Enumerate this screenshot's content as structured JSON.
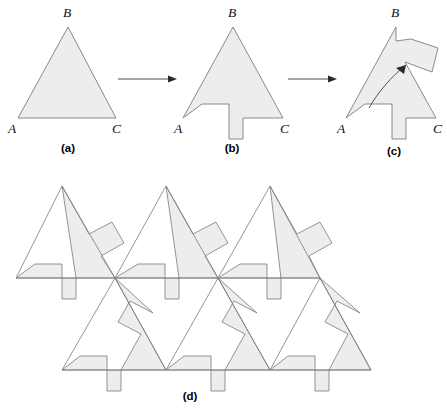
{
  "figure": {
    "canvas": {
      "width": 447,
      "height": 412
    },
    "colors": {
      "tile_fill": "#ededed",
      "tile_stroke": "#7d7d7d",
      "arrow": "#2a2a2a",
      "label": "#111111",
      "background": "#ffffff"
    }
  },
  "panels": [
    {
      "id": "a",
      "caption": "(a)",
      "caption_x": 68,
      "caption_y": 152,
      "description": "plain triangle ABC",
      "shape_points": "18,118 68,27 116,118",
      "vertex_labels": [
        {
          "name": "A",
          "text": "A",
          "x": 8,
          "y": 133
        },
        {
          "name": "B",
          "text": "B",
          "x": 63,
          "y": 17
        },
        {
          "name": "C",
          "text": "C",
          "x": 112,
          "y": 133
        }
      ]
    },
    {
      "id": "b",
      "caption": "(b)",
      "caption_x": 232,
      "caption_y": 152,
      "description": "triangle with notch and tab cut along side AC",
      "shape_points": "183,118 202,104 229,104 229,139 243,139 243,118 283,118 233,27",
      "vertex_labels": [
        {
          "name": "A",
          "text": "A",
          "x": 174,
          "y": 133
        },
        {
          "name": "B",
          "text": "B",
          "x": 228,
          "y": 17
        },
        {
          "name": "C",
          "text": "C",
          "x": 280,
          "y": 133
        }
      ]
    },
    {
      "id": "c",
      "caption": "(c)",
      "caption_x": 394,
      "caption_y": 155,
      "description": "notch and tab translated up to side BC forming the tile",
      "shape_points": "346,118 365,104 392,104 392,139 406,139 406,118 436,118 405,62 432,72 438,48 411,39 396,41 396,27",
      "vertex_labels": [
        {
          "name": "A",
          "text": "A",
          "x": 337,
          "y": 133
        },
        {
          "name": "B",
          "text": "B",
          "x": 391,
          "y": 17
        },
        {
          "name": "C",
          "text": "C",
          "x": 433,
          "y": 133
        }
      ],
      "motion_arrow": {
        "path": "M 369,108 C 378,92 392,76 406,65",
        "head_points": "406,65 396,68 404,74"
      }
    },
    {
      "id": "d",
      "caption": "(d)",
      "caption_x": 190,
      "caption_y": 400,
      "description": "tiles assembled into a plane-filling tessellation"
    }
  ],
  "arrows": [
    {
      "name": "arrow-a-to-b",
      "line": {
        "x1": 118,
        "y1": 79,
        "x2": 172,
        "y2": 79
      },
      "head_points": "177,79 168,75.5 168,82.5"
    },
    {
      "name": "arrow-b-to-c",
      "line": {
        "x1": 288,
        "y1": 79,
        "x2": 332,
        "y2": 79
      },
      "head_points": "337,79 328,75.5 328,82.5"
    }
  ],
  "tessellation": {
    "description": "Six notched triangles meeting around shared vertices; upward-pointing and downward-pointing tiles interlock.",
    "outline_paths": [
      "M 62,186 L 115,278 L 16,278 Z",
      "M 166,186 L 218,278 L 115,278 Z",
      "M 270,186 L 320,278 L 218,278 Z",
      "M 115,278 L 166,370 L 62,370 Z",
      "M 218,278 L 270,370 L 166,370 Z",
      "M 320,278 L 371,370 L 270,370 Z"
    ],
    "tiles": [
      {
        "name": "tile-up-left",
        "points": "62,186 89,234 112,222 124,243 101,256 115,278 16,278 35,264 62,264 62,299 76,299 76,278"
      },
      {
        "name": "tile-up-mid",
        "points": "166,186 193,234 216,222 228,243 205,256 218,278 115,278 138,264 165,264 165,299 179,299 179,278"
      },
      {
        "name": "tile-up-right",
        "points": "270,186 297,234 320,222 332,243 309,256 320,278 218,278 240,264 267,264 267,299 281,299 281,278"
      },
      {
        "name": "tile-down-left",
        "points": "115,278 166,370 62,370 80,356 107,356 107,391 121,391 121,370 141,334 118,322 130,301 153,313"
      },
      {
        "name": "tile-down-mid",
        "points": "218,278 270,370 166,370 184,356 211,356 211,391 225,391 225,370 245,334 222,322 234,301 257,313"
      },
      {
        "name": "tile-down-right",
        "points": "320,278 371,370 270,370 288,356 315,356 315,391 329,391 329,370 348,334 325,322 337,301 360,313"
      }
    ],
    "boundary_outline": "M 62,186 L 89,234 L 112,222 L 124,243 L 101,256 L 115,278 L 16,278 L 35,264 L 62,264 L 62,299 L 76,299 L 76,278",
    "shared_vertices": [
      {
        "x": 115,
        "y": 278
      },
      {
        "x": 218,
        "y": 278
      },
      {
        "x": 320,
        "y": 278
      }
    ]
  }
}
